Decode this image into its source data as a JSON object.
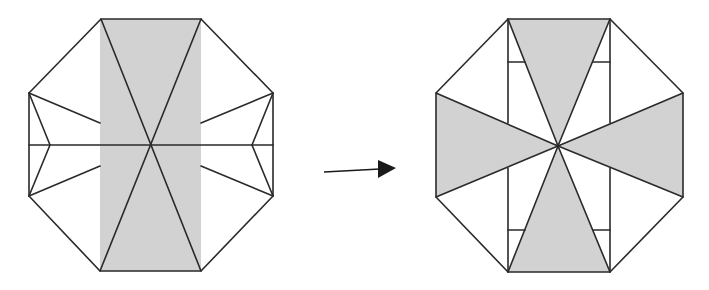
{
  "diagram": {
    "type": "origami-fold-sequence",
    "colors": {
      "line": "#2a2a2a",
      "shade": "#d2d2d2",
      "background": "#ffffff",
      "arrow": "#1a1a1a"
    },
    "steps": [
      {
        "id": "before",
        "description": "Octagon with shaded vertical central rectangle, X diagonals and horizontal midline, notched side flaps",
        "octagon": [
          [
            101,
            19
          ],
          [
            201,
            19
          ],
          [
            273,
            93
          ],
          [
            273,
            196
          ],
          [
            201,
            271
          ],
          [
            100,
            271
          ],
          [
            29,
            196
          ],
          [
            29,
            93
          ]
        ],
        "shaded_regions": [
          [
            [
              100,
              19
            ],
            [
              201,
              19
            ],
            [
              201,
              271
            ],
            [
              100,
              271
            ]
          ]
        ],
        "lines": [
          [
            [
              101,
              19
            ],
            [
              201,
              271
            ]
          ],
          [
            [
              201,
              19
            ],
            [
              100,
              271
            ]
          ],
          [
            [
              29,
              145
            ],
            [
              273,
              145
            ]
          ],
          [
            [
              29,
              93
            ],
            [
              50,
              145
            ]
          ],
          [
            [
              50,
              145
            ],
            [
              29,
              196
            ]
          ],
          [
            [
              29,
              93
            ],
            [
              100,
              123
            ]
          ],
          [
            [
              29,
              196
            ],
            [
              100,
              166
            ]
          ],
          [
            [
              273,
              93
            ],
            [
              252,
              145
            ]
          ],
          [
            [
              252,
              145
            ],
            [
              273,
              196
            ]
          ],
          [
            [
              273,
              93
            ],
            [
              201,
              123
            ]
          ],
          [
            [
              273,
              196
            ],
            [
              201,
              166
            ]
          ]
        ]
      },
      {
        "id": "after",
        "description": "Octagon with four shaded triangles radiating from center forming a cross / pinwheel",
        "octagon": [
          [
            508,
            19
          ],
          [
            610,
            19
          ],
          [
            683,
            93
          ],
          [
            683,
            197
          ],
          [
            610,
            272
          ],
          [
            508,
            272
          ],
          [
            436,
            197
          ],
          [
            436,
            93
          ]
        ],
        "shaded_regions": [
          [
            [
              508,
              19
            ],
            [
              610,
              19
            ],
            [
              558,
              146
            ]
          ],
          [
            [
              508,
              272
            ],
            [
              610,
              272
            ],
            [
              558,
              146
            ]
          ],
          [
            [
              436,
              93
            ],
            [
              436,
              197
            ],
            [
              558,
              146
            ]
          ],
          [
            [
              683,
              93
            ],
            [
              683,
              197
            ],
            [
              558,
              146
            ]
          ]
        ],
        "lines": [
          [
            [
              508,
              19
            ],
            [
              558,
              146
            ]
          ],
          [
            [
              610,
              19
            ],
            [
              558,
              146
            ]
          ],
          [
            [
              508,
              272
            ],
            [
              558,
              146
            ]
          ],
          [
            [
              610,
              272
            ],
            [
              558,
              146
            ]
          ],
          [
            [
              436,
              93
            ],
            [
              558,
              146
            ]
          ],
          [
            [
              436,
              197
            ],
            [
              558,
              146
            ]
          ],
          [
            [
              683,
              93
            ],
            [
              558,
              146
            ]
          ],
          [
            [
              683,
              197
            ],
            [
              558,
              146
            ]
          ],
          [
            [
              508,
              19
            ],
            [
              508,
              123
            ]
          ],
          [
            [
              508,
              168
            ],
            [
              508,
              272
            ]
          ],
          [
            [
              610,
              19
            ],
            [
              610,
              123
            ]
          ],
          [
            [
              610,
              168
            ],
            [
              610,
              272
            ]
          ],
          [
            [
              508,
              62
            ],
            [
              525,
              62
            ]
          ],
          [
            [
              593,
              62
            ],
            [
              610,
              62
            ]
          ],
          [
            [
              508,
              230
            ],
            [
              525,
              230
            ]
          ],
          [
            [
              593,
              230
            ],
            [
              610,
              230
            ]
          ]
        ]
      }
    ],
    "arrow": {
      "from": [
        324,
        172
      ],
      "to": [
        380,
        169
      ],
      "head_tip": [
        396,
        168
      ],
      "meaning": "transforms-into"
    }
  }
}
